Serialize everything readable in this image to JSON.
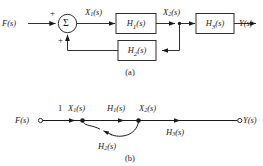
{
  "figure": {
    "background_color": "#ffffff",
    "line_color": "#1a1a1a",
    "block_fill": "#ffffff",
    "panels": [
      {
        "caption": "(a)",
        "type": "block-diagram"
      },
      {
        "caption": "(b)",
        "type": "signal-flow-graph"
      }
    ]
  },
  "block_diagram": {
    "caption": "(a)",
    "input_label": "F(s)",
    "output_label": "Y(s)",
    "summing_junction": {
      "symbol": "Σ",
      "input_sign_top": "+",
      "input_sign_bottom": "+"
    },
    "signals": {
      "x1": "X",
      "x1_sub": "1",
      "x1_arg": "(s)",
      "x2": "X",
      "x2_sub": "2",
      "x2_arg": "(s)"
    },
    "blocks": [
      {
        "name": "H",
        "sub": "1",
        "arg": "(s)",
        "path": "forward"
      },
      {
        "name": "H",
        "sub": "2",
        "arg": "(s)",
        "path": "feedback"
      },
      {
        "name": "H",
        "sub": "3",
        "arg": "(s)",
        "path": "forward"
      }
    ]
  },
  "signal_flow_graph": {
    "caption": "(b)",
    "source_label": "F(s)",
    "sink_label": "Y(s)",
    "nodes": [
      {
        "id": "F",
        "label": "F(s)",
        "kind": "source"
      },
      {
        "id": "X1",
        "label": "X",
        "sub": "1",
        "arg": "(s)",
        "kind": "mixed"
      },
      {
        "id": "X2",
        "label": "X",
        "sub": "2",
        "arg": "(s)",
        "kind": "mixed"
      },
      {
        "id": "Y",
        "label": "Y(s)",
        "kind": "sink"
      }
    ],
    "branches": [
      {
        "from": "F",
        "to": "X1",
        "gain": "1",
        "gain_sub": "",
        "shape": "straight"
      },
      {
        "from": "X1",
        "to": "X2",
        "gain": "H",
        "gain_sub": "1",
        "gain_arg": "(s)",
        "shape": "straight"
      },
      {
        "from": "X2",
        "to": "Y",
        "gain": "H",
        "gain_sub": "3",
        "gain_arg": "(s)",
        "shape": "straight"
      },
      {
        "from": "X2",
        "to": "X1",
        "gain": "H",
        "gain_sub": "2",
        "gain_arg": "(s)",
        "shape": "curved-below"
      }
    ]
  }
}
